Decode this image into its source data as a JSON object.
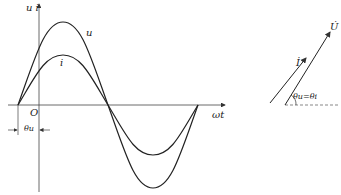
{
  "waveform": {
    "axis_label_y": "u  i",
    "axis_label_x": "ωt",
    "origin": "O",
    "curve_u_label": "u",
    "curve_i_label": "i",
    "phase_label": "θu",
    "u_amplitude_px": 83,
    "i_amplitude_px": 50
  },
  "phasor": {
    "voltage_label": "U̇",
    "current_label": "İ",
    "angle_label": "θu=θi"
  },
  "colors": {
    "line": "#222222",
    "axis": "#444444"
  }
}
